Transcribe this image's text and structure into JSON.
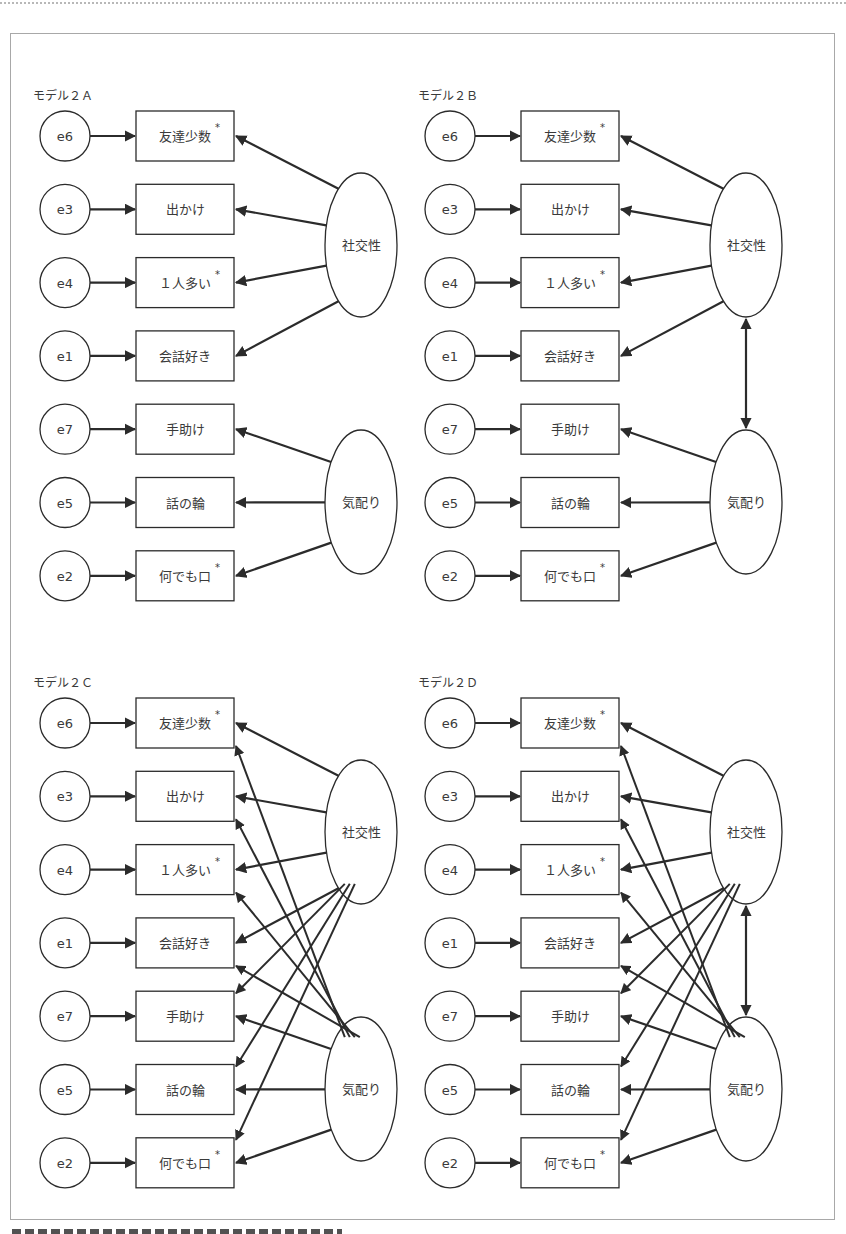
{
  "figure": {
    "caption_visible": "",
    "panels": [
      {
        "id": "A",
        "title": "モデル２Ａ",
        "ox": 0,
        "oy": 0,
        "correlated": false,
        "cross_loadings": false
      },
      {
        "id": "B",
        "title": "モデル２Ｂ",
        "ox": 385,
        "oy": 0,
        "correlated": true,
        "cross_loadings": false
      },
      {
        "id": "C",
        "title": "モデル２Ｃ",
        "ox": 0,
        "oy": 587,
        "correlated": false,
        "cross_loadings": true
      },
      {
        "id": "D",
        "title": "モデル２Ｄ",
        "ox": 385,
        "oy": 587,
        "correlated": true,
        "cross_loadings": true
      }
    ],
    "errors": [
      "e6",
      "e3",
      "e4",
      "e1",
      "e7",
      "e5",
      "e2"
    ],
    "observed": [
      {
        "label": "友達少数",
        "reversed": true,
        "factor": 0
      },
      {
        "label": "出かけ",
        "reversed": false,
        "factor": 0
      },
      {
        "label": "１人多い",
        "reversed": true,
        "factor": 0
      },
      {
        "label": "会話好き",
        "reversed": false,
        "factor": 0
      },
      {
        "label": "手助け",
        "reversed": false,
        "factor": 1
      },
      {
        "label": "話の輪",
        "reversed": false,
        "factor": 1
      },
      {
        "label": "何でも口",
        "reversed": true,
        "factor": 1
      }
    ],
    "factors": [
      {
        "label": "社交性",
        "cy": 245
      },
      {
        "label": "気配り",
        "cy": 502
      }
    ],
    "reversed_mark": "*",
    "colors": {
      "stroke": "#2b2b2b",
      "frame": "#a8a8a8",
      "text": "#3a3a3a"
    }
  }
}
